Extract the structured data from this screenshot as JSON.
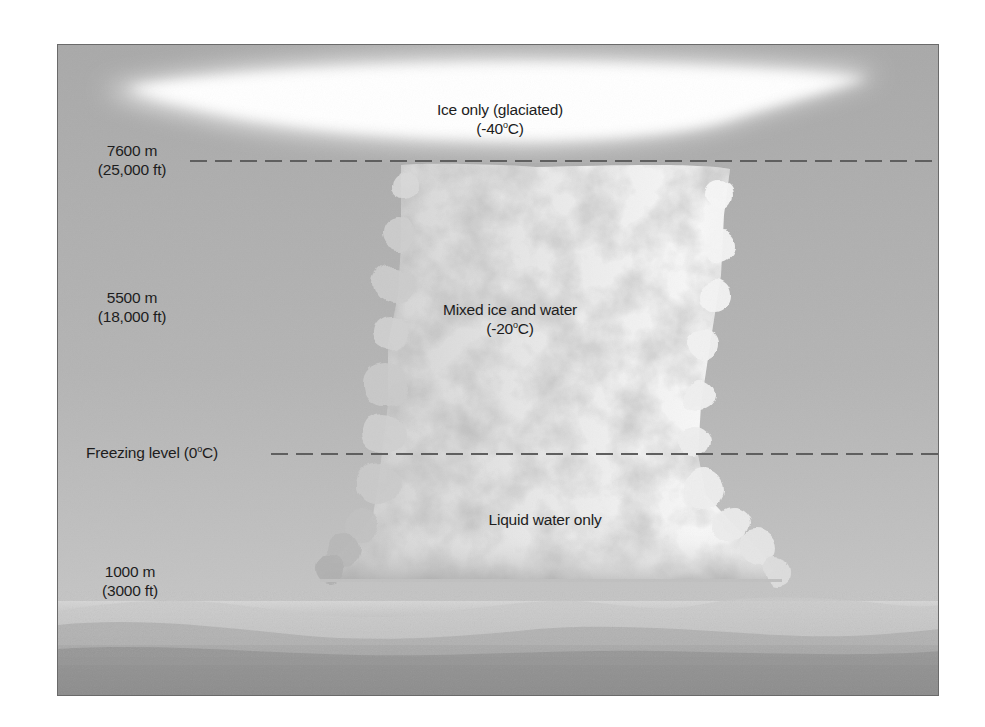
{
  "diagram": {
    "colors": {
      "sky_top": "#a9a9a9",
      "sky_bottom": "#cfcfcf",
      "cloud_light": "#f4f4f4",
      "cloud_shadow": "#8e8e8e",
      "dash_line": "#5f5f5f",
      "text": "#1d1d1d",
      "ground_dark": "#8a8a8a"
    },
    "zones": [
      {
        "id": "top",
        "line1": "Ice only (glaciated)",
        "line2_prefix": "(-40",
        "line2_degree": "o",
        "line2_suffix": "C)"
      },
      {
        "id": "middle",
        "line1": "Mixed ice and water",
        "line2_prefix": "(-20",
        "line2_degree": "o",
        "line2_suffix": "C)"
      },
      {
        "id": "bottom",
        "line1": "Liquid water only"
      }
    ],
    "altitude_labels": [
      {
        "id": "7600",
        "meters": "7600 m",
        "feet": "(25,000 ft)",
        "has_dashed_line": true
      },
      {
        "id": "5500",
        "meters": "5500 m",
        "feet": "(18,000 ft)",
        "has_dashed_line": false
      },
      {
        "id": "1000",
        "meters": "1000 m",
        "feet": "(3000 ft)",
        "has_dashed_line": false
      }
    ],
    "freezing_level": {
      "prefix": "Freezing level (0",
      "degree": "o",
      "suffix": "C)",
      "has_dashed_line": true
    }
  }
}
